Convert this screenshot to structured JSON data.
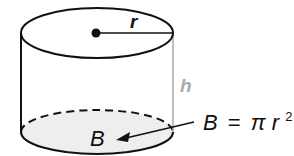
{
  "diagram": {
    "labels": {
      "radius": "r",
      "height": "h",
      "base": "B"
    },
    "formula": {
      "lhs": "B",
      "equals": "=",
      "pi": "π",
      "var": "r",
      "exponent": "2"
    },
    "colors": {
      "outline": "#111111",
      "height_line": "#aaaaaa",
      "base_fill": "#eeeeee",
      "center_dot": "#111111"
    }
  }
}
